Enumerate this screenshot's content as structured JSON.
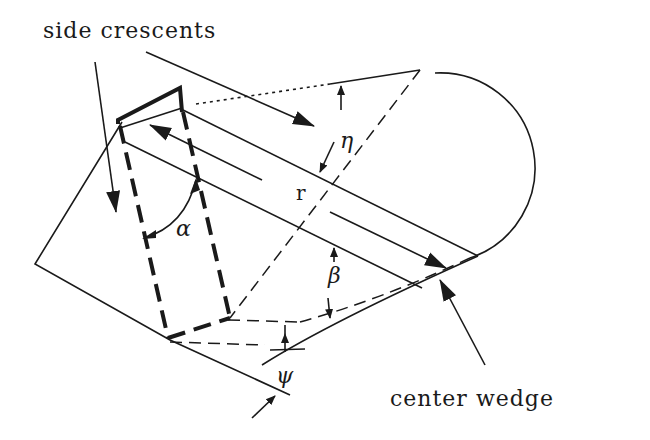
{
  "diagram": {
    "labels": {
      "side_crescents": "side crescents",
      "center_wedge": "center wedge",
      "r": "r",
      "eta": "η",
      "alpha": "α",
      "beta": "β",
      "psi": "ψ"
    },
    "colors": {
      "ink": "#1a1a1a",
      "background": "#ffffff"
    }
  }
}
